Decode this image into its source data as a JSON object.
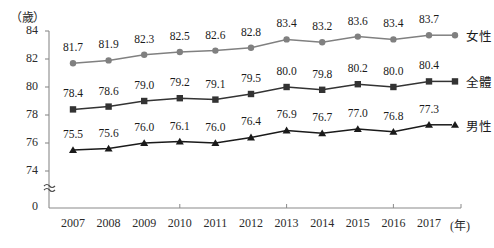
{
  "chart_data": {
    "type": "line",
    "title": "",
    "xlabel": "年",
    "ylabel": "歲",
    "unit_label": "（歲）",
    "x_unit_label": "(年)",
    "grid": false,
    "legend_position": "right",
    "axis_break": "≈",
    "categories": [
      "2007",
      "2008",
      "2009",
      "2010",
      "2011",
      "2012",
      "2013",
      "2014",
      "2015",
      "2016",
      "2017"
    ],
    "ylim": [
      74,
      84
    ],
    "yticks": [
      "84",
      "82",
      "80",
      "78",
      "76",
      "74",
      "0"
    ],
    "series": [
      {
        "name": "女性",
        "marker": "circle",
        "color": "#808080",
        "values": [
          81.7,
          81.9,
          82.3,
          82.5,
          82.6,
          82.8,
          83.4,
          83.2,
          83.6,
          83.4,
          83.7
        ],
        "labels": [
          "81.7",
          "81.9",
          "82.3",
          "82.5",
          "82.6",
          "82.8",
          "83.4",
          "83.2",
          "83.6",
          "83.4",
          "83.7"
        ]
      },
      {
        "name": "全體",
        "marker": "square",
        "color": "#333333",
        "values": [
          78.4,
          78.6,
          79.0,
          79.2,
          79.1,
          79.5,
          80.0,
          79.8,
          80.2,
          80.0,
          80.4
        ],
        "labels": [
          "78.4",
          "78.6",
          "79.0",
          "79.2",
          "79.1",
          "79.5",
          "80.0",
          "79.8",
          "80.2",
          "80.0",
          "80.4"
        ]
      },
      {
        "name": "男性",
        "marker": "triangle",
        "color": "#1a1a1a",
        "values": [
          75.5,
          75.6,
          76.0,
          76.1,
          76.0,
          76.4,
          76.9,
          76.7,
          77.0,
          76.8,
          77.3
        ],
        "labels": [
          "75.5",
          "75.6",
          "76.0",
          "76.1",
          "76.0",
          "76.4",
          "76.9",
          "76.7",
          "77.0",
          "76.8",
          "77.3"
        ]
      }
    ]
  }
}
